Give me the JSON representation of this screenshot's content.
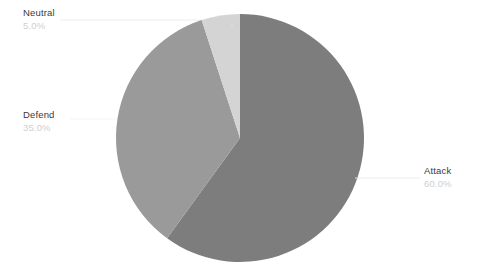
{
  "chart_data": {
    "type": "pie",
    "title": "",
    "categories": [
      "Attack",
      "Defend",
      "Neutral"
    ],
    "values": [
      60.0,
      35.0,
      5.0
    ],
    "value_labels": [
      "60.0%",
      "35.0%",
      "5.0%"
    ],
    "colors": [
      "#7d7d7d",
      "#9a9a9a",
      "#d4d4d4"
    ],
    "background": "#ffffff",
    "start_angle_deg": 90,
    "direction": "clockwise",
    "legend": "none",
    "labels_position": "outside-with-leader-lines",
    "center": {
      "x": 240,
      "y": 138
    },
    "radius": 124,
    "slices": [
      {
        "name": "Attack",
        "percent_label": "60.0%",
        "value": 60.0,
        "color": "#7d7d7d",
        "label_x": 424,
        "label_y": 166
      },
      {
        "name": "Defend",
        "percent_label": "35.0%",
        "value": 35.0,
        "color": "#9a9a9a",
        "label_x": 23,
        "label_y": 110
      },
      {
        "name": "Neutral",
        "percent_label": "5.0%",
        "value": 5.0,
        "color": "#d4d4d4",
        "label_x": 23,
        "label_y": 8
      }
    ]
  }
}
